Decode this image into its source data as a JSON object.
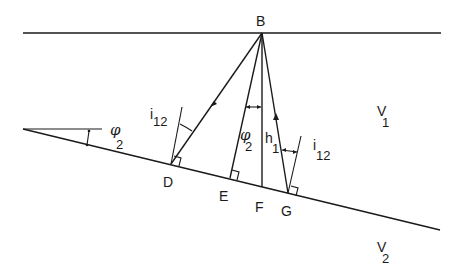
{
  "diagram": {
    "type": "seismic refraction / reflection geometry over a dipping interface",
    "points": {
      "B": "B",
      "D": "D",
      "E": "E",
      "F": "F",
      "G": "G"
    },
    "labels": {
      "critical_angle_left": {
        "base": "i",
        "sub": "12"
      },
      "critical_angle_right": {
        "base": "i",
        "sub": "12"
      },
      "dip_angle_left": {
        "base": "φ",
        "sub": "2"
      },
      "dip_angle_center": {
        "base": "φ",
        "sub": "2"
      },
      "depth": {
        "base": "h",
        "sub": "1"
      },
      "velocity_upper": {
        "base": "V",
        "sub": "1"
      },
      "velocity_lower": {
        "base": "V",
        "sub": "2"
      }
    },
    "colors": {
      "line": "#1a1a1a",
      "background": "#ffffff"
    }
  }
}
